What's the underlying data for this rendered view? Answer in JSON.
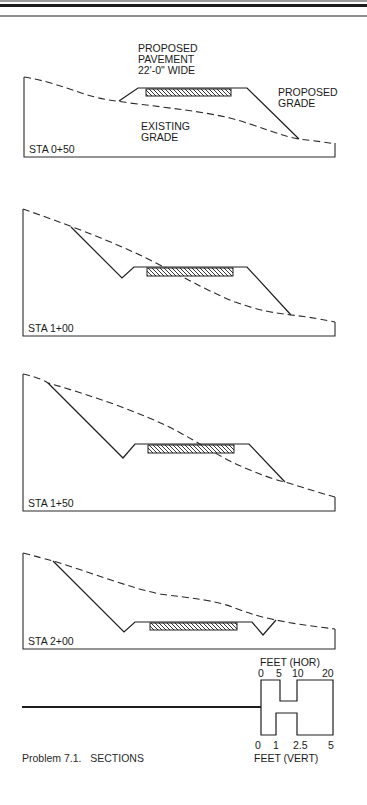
{
  "figure": {
    "caption": "Problem 7.1.   SECTIONS",
    "colors": {
      "ink": "#1e1e1e",
      "paper": "#ffffff",
      "rule": "#8f8f8f"
    }
  },
  "sections": [
    {
      "station": "STA 0+50",
      "labels": {
        "pavement_line1": "PROPOSED",
        "pavement_line2": "PAVEMENT",
        "pavement_line3": "22'-0\" WIDE",
        "proposed_line1": "PROPOSED",
        "proposed_line2": "GRADE",
        "existing_line1": "EXISTING",
        "existing_line2": "GRADE"
      }
    },
    {
      "station": "STA 1+00"
    },
    {
      "station": "STA 1+50"
    },
    {
      "station": "STA 2+00"
    }
  ],
  "scale_bar": {
    "horizontal_title": "FEET (HOR)",
    "horizontal_ticks": [
      "0",
      "5",
      "10",
      "20"
    ],
    "vertical_title": "FEET (VERT)",
    "vertical_ticks": [
      "0",
      "1",
      "2.5",
      "5"
    ]
  }
}
